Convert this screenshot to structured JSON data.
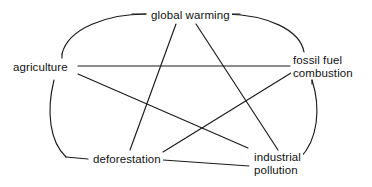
{
  "diagram": {
    "type": "concept-map",
    "shape": "pentagram-with-pentagon-arcs",
    "background_color": "#ffffff",
    "stroke_color": "#1a1a1a",
    "text_color": "#111111",
    "nodes": [
      {
        "id": "global-warming",
        "label": "global warming",
        "label_line2": ""
      },
      {
        "id": "agriculture",
        "label": "agriculture",
        "label_line2": ""
      },
      {
        "id": "fossil-fuel",
        "label": "fossil fuel",
        "label_line2": "combustion"
      },
      {
        "id": "deforestation",
        "label": "deforestation",
        "label_line2": ""
      },
      {
        "id": "industrial",
        "label": "industrial",
        "label_line2": "pollution"
      }
    ],
    "edges": [
      {
        "from": "agriculture",
        "to": "global-warming",
        "style": "curved-arc"
      },
      {
        "from": "global-warming",
        "to": "fossil-fuel",
        "style": "curved-arc"
      },
      {
        "from": "fossil-fuel",
        "to": "industrial",
        "style": "curved-arc"
      },
      {
        "from": "deforestation",
        "to": "industrial",
        "style": "straight"
      },
      {
        "from": "agriculture",
        "to": "deforestation",
        "style": "curved-arc"
      },
      {
        "from": "agriculture",
        "to": "fossil-fuel",
        "style": "straight"
      },
      {
        "from": "agriculture",
        "to": "industrial",
        "style": "straight"
      },
      {
        "from": "global-warming",
        "to": "deforestation",
        "style": "straight"
      },
      {
        "from": "global-warming",
        "to": "industrial",
        "style": "straight"
      },
      {
        "from": "fossil-fuel",
        "to": "deforestation",
        "style": "straight"
      }
    ]
  }
}
